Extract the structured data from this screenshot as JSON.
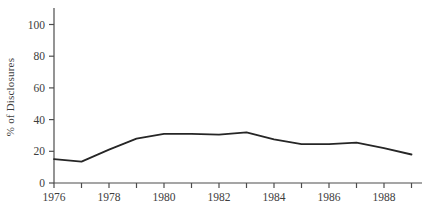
{
  "chart_data": {
    "type": "line",
    "title": "",
    "xlabel": "",
    "ylabel": "% of Disclosures",
    "x": [
      1976,
      1977,
      1978,
      1979,
      1980,
      1981,
      1982,
      1983,
      1984,
      1985,
      1986,
      1987,
      1988,
      1989
    ],
    "values": [
      15,
      13.5,
      21,
      28,
      31,
      31,
      30.5,
      32,
      27.5,
      24.5,
      24.5,
      25.5,
      22,
      18
    ],
    "series_name": "% of Disclosures",
    "ylim": [
      0,
      100
    ],
    "xlim": [
      1976,
      1989
    ],
    "y_ticks": [
      0,
      20,
      40,
      60,
      80,
      100
    ],
    "x_ticks": [
      1976,
      1977,
      1978,
      1979,
      1980,
      1981,
      1982,
      1983,
      1984,
      1985,
      1986,
      1987,
      1988,
      1989
    ],
    "x_tick_labels": [
      "1976",
      "1978",
      "1980",
      "1982",
      "1984",
      "1986",
      "1988"
    ],
    "grid": false,
    "legend": "none"
  },
  "colors": {
    "background": "#ffffff",
    "line": "#262626",
    "axis": "#4d4d4d",
    "text": "#3d3d3d"
  }
}
